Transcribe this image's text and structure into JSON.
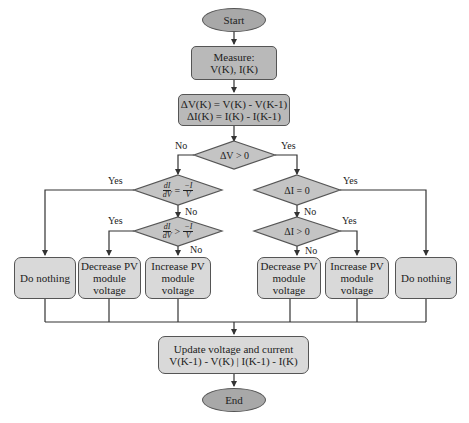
{
  "diagram": {
    "colors": {
      "terminal_fill": "#a8a8a8",
      "process_dark_fill": "#b9b9b9",
      "process_fill": "#d9d9d9",
      "decision_fill": "#c4c4c4",
      "stroke": "#555555",
      "background": "#ffffff"
    },
    "nodes": {
      "start": "Start",
      "measure": "Measure:\nV(K), I(K)",
      "delta": "ΔV(K) = V(K) - V(K-1)\nΔI(K) = I(K) - I(K-1)",
      "dec_dv": "ΔV > 0",
      "dec_left1": {
        "num_l": "dI",
        "den_l": "dV",
        "op": "=",
        "num_r": "−I",
        "den_r": "V"
      },
      "dec_left2": {
        "num_l": "dI",
        "den_l": "dV",
        "op": ">",
        "num_r": "−I",
        "den_r": "V"
      },
      "dec_right1": "ΔI = 0",
      "dec_right2": "ΔI > 0",
      "do_nothing_left": "Do nothing",
      "decrease_left": "Decrease PV\nmodule\nvoltage",
      "increase_left": "Increase PV\nmodule\nvoltage",
      "decrease_right": "Decrease PV\nmodule\nvoltage",
      "increase_right": "Increase PV\nmodule\nvoltage",
      "do_nothing_right": "Do nothing",
      "update": "Update voltage and current\nV(K-1) - V(K) | I(K-1) - I(K)",
      "end": "End"
    },
    "edge_labels": {
      "dv_no": "No",
      "dv_yes": "Yes",
      "left1_yes": "Yes",
      "left1_no": "No",
      "left2_yes": "Yes",
      "left2_no": "No",
      "right1_yes": "Yes",
      "right1_no": "No",
      "right2_yes": "Yes",
      "right2_no": "No"
    }
  }
}
